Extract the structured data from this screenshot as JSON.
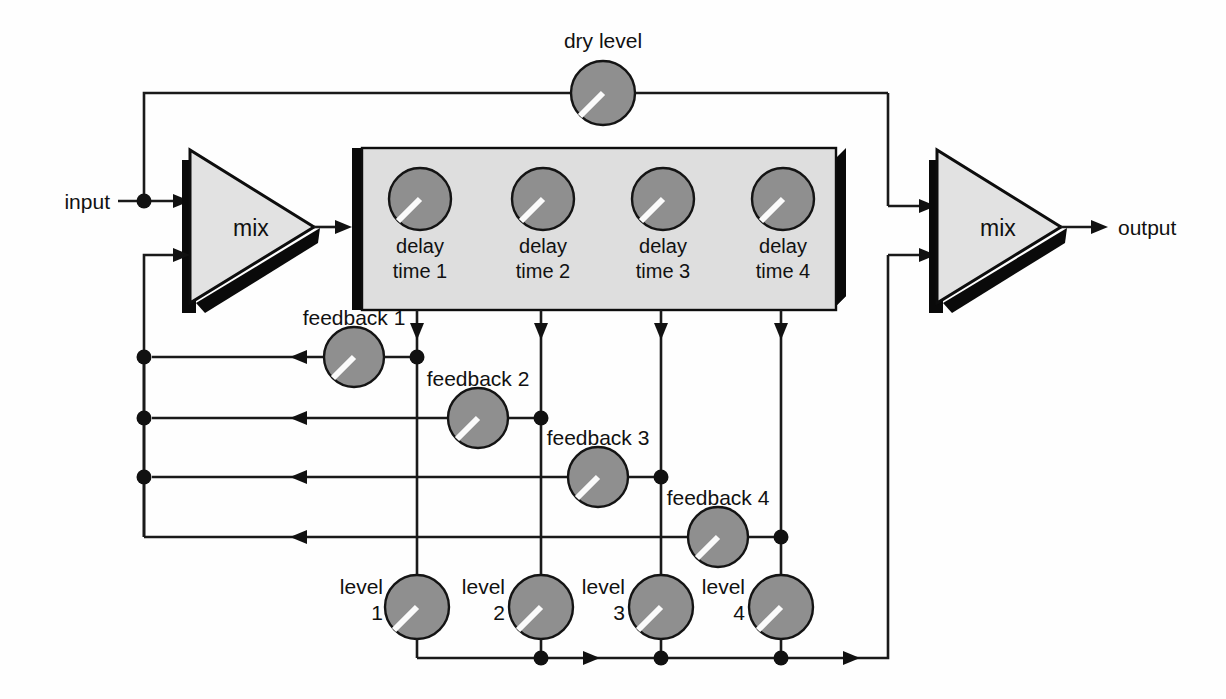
{
  "diagram": {
    "canvas": {
      "width": 1226,
      "height": 699
    },
    "background_color": "#ffffff",
    "line_color": "#1a1a1a",
    "knob_color": "#8f8f8f",
    "knob_pointer_color": "#fbfbfb",
    "panel_color": "#dedede",
    "shadow_color": "#0a0a0a"
  },
  "labels": {
    "input": "input",
    "output": "output",
    "dry_level": "dry level",
    "mix_in": "mix",
    "mix_out": "mix"
  },
  "delay_panel": {
    "knobs": [
      {
        "line1": "delay",
        "line2": "time 1"
      },
      {
        "line1": "delay",
        "line2": "time 2"
      },
      {
        "line1": "delay",
        "line2": "time 3"
      },
      {
        "line1": "delay",
        "line2": "time 4"
      }
    ]
  },
  "feedback_knobs": [
    {
      "label": "feedback 1"
    },
    {
      "label": "feedback 2"
    },
    {
      "label": "feedback 3"
    },
    {
      "label": "feedback 4"
    }
  ],
  "level_knobs": [
    {
      "line1": "level",
      "line2": "1"
    },
    {
      "line1": "level",
      "line2": "2"
    },
    {
      "line1": "level",
      "line2": "3"
    },
    {
      "line1": "level",
      "line2": "4"
    }
  ],
  "dry_knob": {
    "label": "dry level"
  }
}
